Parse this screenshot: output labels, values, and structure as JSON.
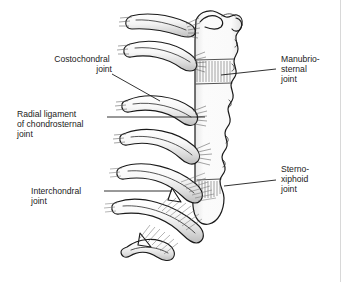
{
  "figure": {
    "background_color": "#ffffff",
    "ink_color": "#1b1b1b",
    "bone_fill": "#fbfbfb",
    "cartilage_fill": "#f0f0f0",
    "shadow_color": "#b8b8b8",
    "fiber_color": "#585858",
    "edge_rule_color": "#d8d8d8"
  },
  "labels": [
    {
      "id": "costochondral",
      "name": "costochondral-joint-label",
      "side": "left",
      "lines": [
        "Costochondral",
        "joint"
      ],
      "text_x": 45,
      "text_y": 62,
      "leader": "M112,74 L160,101"
    },
    {
      "id": "radial-ligament",
      "name": "radial-ligament-label",
      "side": "left",
      "lines": [
        "Radial ligament",
        "of chondrosternal",
        "joint"
      ],
      "text_x": 17,
      "text_y": 117,
      "leader": "M107,117 L205,117"
    },
    {
      "id": "interchondral",
      "name": "interchondral-joint-label",
      "side": "left",
      "lines": [
        "Interchondral",
        "joint"
      ],
      "text_x": 31,
      "text_y": 194,
      "leader": "M104,191 L172,191"
    },
    {
      "id": "manubriosternal",
      "name": "manubriosternal-joint-label",
      "side": "right",
      "lines": [
        "Manubrio-",
        "sternal",
        "joint"
      ],
      "text_x": 281,
      "text_y": 62,
      "leader": "M276,69 L221,75"
    },
    {
      "id": "sternoxiphoid",
      "name": "sternoxiphoid-joint-label",
      "side": "right",
      "lines": [
        "Sterno-",
        "xiphoid",
        "joint"
      ],
      "text_x": 281,
      "text_y": 172,
      "leader": "M276,180 L224,186"
    }
  ],
  "structures": {
    "sternum": "sternum-outline",
    "manubrium": "manubrium",
    "sternal_body": "sternal-body",
    "xiphoid_process": "xiphoid-process",
    "clavicular_notch": "clavicular-notch",
    "costal_cartilages_count": 7,
    "ligament_fiber_bands": 7
  }
}
